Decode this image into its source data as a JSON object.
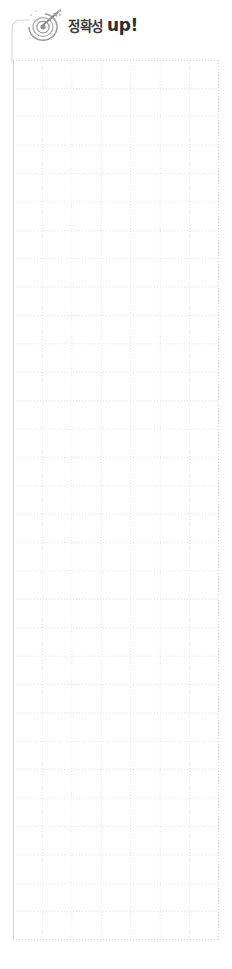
{
  "page": {
    "background_color": "#ffffff",
    "width": 232,
    "height": 969
  },
  "header": {
    "icon_name": "target-dartboard-icon",
    "title_korean": "정확성",
    "title_english": "up!",
    "title_full": "정확성 up!",
    "korean_text_color": "#3b3b3b",
    "english_text_color": "#2e2e2e",
    "icon_color": "#8c8c8c",
    "connector_name": "header-to-grid-connector",
    "connector_color": "#d8d8d8"
  },
  "grid": {
    "label": "dotted-worksheet-grid",
    "columns": 7,
    "rows": 31,
    "cell_width": 29.4,
    "cell_height": 28.4,
    "left": 13,
    "top": 60,
    "width": 206,
    "height": 880,
    "line_color": "#e3e3e3",
    "border_color": "#d5d5d5",
    "dash_pattern": "1 2"
  }
}
